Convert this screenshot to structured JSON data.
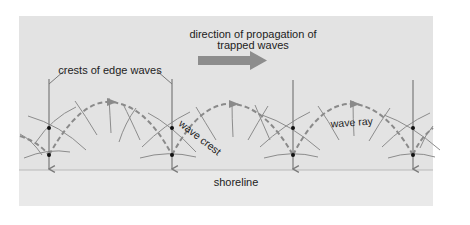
{
  "diagram": {
    "labels": {
      "direction_line1": "direction of propagation of",
      "direction_line2": "trapped waves",
      "crests_of_edge_waves": "crests of edge waves",
      "wave_crest": "wave crest",
      "wave_ray": "wave ray",
      "shoreline": "shoreline"
    },
    "colors": {
      "page_background": "#ffffff",
      "sea_background": "#e3e3e3",
      "shore_background": "#e9e9e9",
      "shoreline_line": "#b9b9b9",
      "crest_line": "#7a7a7a",
      "wave_crest_line": "#8c8c8c",
      "wave_ray_dashed": "#8a8a8a",
      "direction_arrow": "#8d8d8d",
      "dot": "#111111",
      "text": "#222222"
    },
    "edge_wave_crest_x": [
      49,
      172,
      293,
      413
    ],
    "nodes_y": [
      128,
      155
    ]
  }
}
